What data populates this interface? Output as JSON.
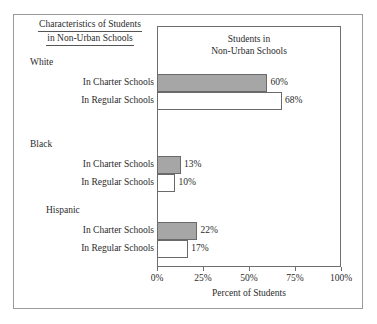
{
  "caption": {
    "line1": "Characteristics of Students",
    "line2": "in Non-Urban Schools"
  },
  "plot_title": {
    "line1": "Students in",
    "line2": "Non-Urban Schools"
  },
  "axis": {
    "x_title": "Percent of Students",
    "ticks": [
      "0%",
      "25%",
      "50%",
      "75%",
      "100%"
    ]
  },
  "groups": [
    {
      "name": "White",
      "rows": [
        {
          "label": "In Charter Schools",
          "value_label": "60%"
        },
        {
          "label": "In Regular Schools",
          "value_label": "68%"
        }
      ]
    },
    {
      "name": "Black",
      "rows": [
        {
          "label": "In Charter Schools",
          "value_label": "13%"
        },
        {
          "label": "In Regular Schools",
          "value_label": "10%"
        }
      ]
    },
    {
      "name": "Hispanic",
      "rows": [
        {
          "label": "In Charter Schools",
          "value_label": "22%"
        },
        {
          "label": "In Regular Schools",
          "value_label": "17%"
        }
      ]
    }
  ],
  "colors": {
    "charter_fill": "#a6a6a6",
    "regular_fill": "#ffffff",
    "bar_border": "#6a6a6a",
    "frame": "#6e6e6e",
    "outer_frame": "#9a9a9a",
    "text": "#2b2b2b"
  },
  "chart_data": {
    "type": "bar",
    "orientation": "horizontal",
    "title": "Students in Non-Urban Schools",
    "caption": "Characteristics of Students in Non-Urban Schools",
    "xlabel": "Percent of Students",
    "ylabel": "",
    "xlim": [
      0,
      100
    ],
    "xticks": [
      0,
      25,
      50,
      75,
      100
    ],
    "xticklabels": [
      "0%",
      "25%",
      "50%",
      "75%",
      "100%"
    ],
    "grid": false,
    "legend": "none",
    "categories": [
      "White",
      "Black",
      "Hispanic"
    ],
    "series": [
      {
        "name": "In Charter Schools",
        "values": [
          60,
          13,
          22
        ],
        "fill": "#a6a6a6"
      },
      {
        "name": "In Regular Schools",
        "values": [
          68,
          10,
          17
        ],
        "fill": "#ffffff"
      }
    ],
    "data_labels": [
      {
        "category": "White",
        "series": "In Charter Schools",
        "label": "60%"
      },
      {
        "category": "White",
        "series": "In Regular Schools",
        "label": "68%"
      },
      {
        "category": "Black",
        "series": "In Charter Schools",
        "label": "13%"
      },
      {
        "category": "Black",
        "series": "In Regular Schools",
        "label": "10%"
      },
      {
        "category": "Hispanic",
        "series": "In Charter Schools",
        "label": "22%"
      },
      {
        "category": "Hispanic",
        "series": "In Regular Schools",
        "label": "17%"
      }
    ]
  },
  "_layout": {
    "plot_left": 157,
    "plot_width": 184,
    "rows": [
      {
        "top": 74,
        "height": 18,
        "value": 60
      },
      {
        "top": 92,
        "height": 18,
        "value": 68
      },
      {
        "top": 156,
        "height": 18,
        "value": 13
      },
      {
        "top": 174,
        "height": 18,
        "value": 10
      },
      {
        "top": 222,
        "height": 18,
        "value": 22
      },
      {
        "top": 240,
        "height": 18,
        "value": 17
      }
    ],
    "group_label_tops": [
      57,
      139,
      205
    ],
    "row_label_tops": [
      77,
      95,
      159,
      177,
      225,
      243
    ]
  }
}
